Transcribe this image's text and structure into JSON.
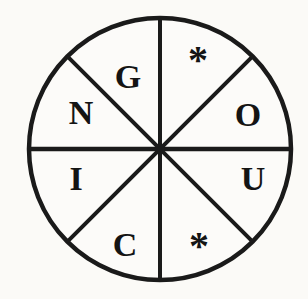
{
  "figure": {
    "background_color": "#fbfaf7",
    "stroke_color": "#1a1a1a",
    "text_color": "#141414",
    "wheel": {
      "sectors": [
        {
          "position": "top-right",
          "label": "*"
        },
        {
          "position": "right-upper",
          "label": "O"
        },
        {
          "position": "right-lower",
          "label": "U"
        },
        {
          "position": "bottom-right",
          "label": "*"
        },
        {
          "position": "bottom-left",
          "label": "C"
        },
        {
          "position": "left-lower",
          "label": "I"
        },
        {
          "position": "left-upper",
          "label": "N"
        },
        {
          "position": "top-left",
          "label": "G"
        }
      ]
    }
  }
}
